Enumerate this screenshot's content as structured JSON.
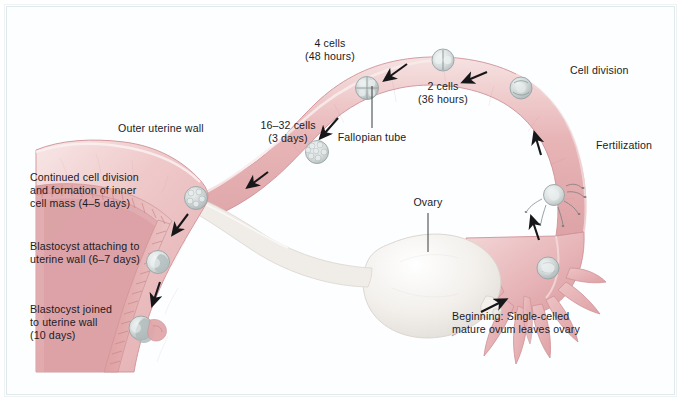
{
  "figure": {
    "background_color": "#ffffff",
    "frame_color": "#e2e9ea",
    "text_color": "#1b1b1f",
    "tissue_pink": "#e9b9bb",
    "tissue_pink_light": "#f2d5d6",
    "endometrium": "#dfa3a4",
    "ovary_white": "#f0eeea",
    "cell_gray": "#c9cfd0",
    "arrow_color": "#17171a"
  },
  "labels": {
    "four_cells": "4 cells\n(48 hours)",
    "two_cells": "2 cells\n(36 hours)",
    "sixteen_thirtytwo_cells": "16–32 cells\n(3 days)",
    "cell_division": "Cell division",
    "fertilization": "Fertilization",
    "fallopian_tube": "Fallopian tube",
    "ovary": "Ovary",
    "outer_uterine_wall": "Outer uterine wall",
    "continued_cell_division": "Continued cell division\nand formation of inner\ncell mass (4–5 days)",
    "blastocyst_attaching": "Blastocyst attaching to\nuterine wall (6–7 days)",
    "blastocyst_joined": "Blastocyst joined\nto uterine wall\n(10 days)",
    "beginning": "Beginning: Single-celled\nmature ovum leaves ovary"
  },
  "stages": [
    {
      "name": "beginning-ovulation",
      "label": "Beginning: Single-celled mature ovum leaves ovary",
      "time": "day 0"
    },
    {
      "name": "fertilization",
      "label": "Fertilization",
      "time": "day 0"
    },
    {
      "name": "cell-division",
      "label": "Cell division",
      "time": "ongoing"
    },
    {
      "name": "two-cell",
      "label": "2 cells",
      "time": "36 hours"
    },
    {
      "name": "four-cell",
      "label": "4 cells",
      "time": "48 hours"
    },
    {
      "name": "morula",
      "label": "16–32 cells",
      "time": "3 days"
    },
    {
      "name": "inner-cell-mass",
      "label": "Continued cell division and formation of inner cell mass",
      "time": "4–5 days"
    },
    {
      "name": "attaching",
      "label": "Blastocyst attaching to uterine wall",
      "time": "6–7 days"
    },
    {
      "name": "implanted",
      "label": "Blastocyst joined to uterine wall",
      "time": "10 days"
    }
  ],
  "anatomy": [
    {
      "name": "fallopian-tube",
      "label": "Fallopian tube"
    },
    {
      "name": "ovary",
      "label": "Ovary"
    },
    {
      "name": "outer-uterine-wall",
      "label": "Outer uterine wall"
    },
    {
      "name": "fimbriae",
      "label": "Fimbriae"
    },
    {
      "name": "uterus",
      "label": "Uterus"
    },
    {
      "name": "endometrium",
      "label": "Endometrium"
    }
  ]
}
